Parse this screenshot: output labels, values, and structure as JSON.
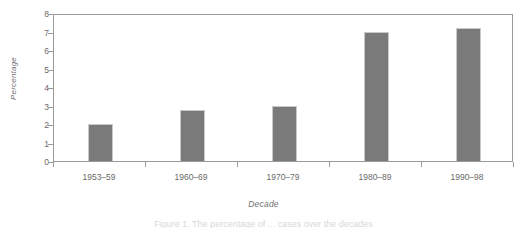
{
  "chart_data": {
    "type": "bar",
    "title": "",
    "subtitle": "",
    "xlabel": "Decade",
    "ylabel": "Percentage",
    "categories": [
      "1953–59",
      "1960–69",
      "1970–79",
      "1980–89",
      "1990–98"
    ],
    "values": [
      2.0,
      2.75,
      3.0,
      7.0,
      7.2
    ],
    "series": [
      {
        "name": "Percentage",
        "values": [
          2.0,
          2.75,
          3.0,
          7.0,
          7.2
        ]
      }
    ],
    "ylim": [
      0,
      8
    ],
    "ytick_labels": [
      "8",
      "7",
      "6",
      "5",
      "4",
      "3",
      "2",
      "1",
      "0"
    ],
    "ytick_values": [
      8,
      7,
      6,
      5,
      4,
      3,
      2,
      1,
      0
    ],
    "grid": false,
    "legend": "none",
    "bar_color": "#7a7a7a",
    "bar_border_color": "#c9c9c9",
    "axis_color": "#9a9a9a",
    "text_color": "#6a6a6a",
    "background": "#ffffff"
  },
  "figure": {
    "caption_fragment": "Figure 1.  The percentage of ... cases over the decades"
  }
}
